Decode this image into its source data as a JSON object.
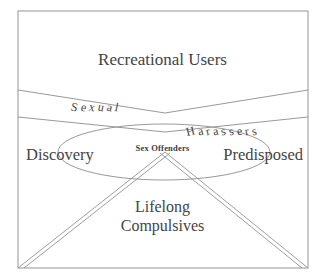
{
  "figure": {
    "title_region": "sex-offender-typology-venn-diagram",
    "frame": {
      "stroke_color": "#9a9a9a",
      "x": 18,
      "y": 11,
      "width": 290,
      "height": 257
    },
    "regions": [
      {
        "name": "recreational-users",
        "label": "Recreational Users",
        "position": "top"
      },
      {
        "name": "sexual-harassers-band",
        "label_left": "Sexual",
        "label_right": "Harassers",
        "position": "middle-v-band"
      },
      {
        "name": "discovery",
        "label": "Discovery",
        "position": "left-ellipse"
      },
      {
        "name": "predisposed",
        "label": "Predisposed",
        "position": "right-ellipse"
      },
      {
        "name": "sex-offenders",
        "label": "Sex Offenders",
        "position": "center-intersection"
      },
      {
        "name": "lifelong-compulsives",
        "label_line1": "Lifelong",
        "label_line2": "Compulsives",
        "position": "bottom-triangle"
      }
    ],
    "shapes": {
      "band_upper_left_y": 90,
      "band_lower_left_y": 117,
      "band_apex_x": 165,
      "band_apex_upper_y": 113,
      "band_apex_lower_y": 132,
      "ellipse_cx": 164,
      "ellipse_cy": 152,
      "ellipse_rx": 106,
      "ellipse_ry": 28,
      "triangle_apex_x": 165,
      "triangle_apex_y": 152,
      "stroke_color": "#8d8d8d"
    }
  },
  "labels": {
    "recreational_users": "Recreational Users",
    "sexual": "Sexual",
    "harassers": "Harassers",
    "discovery": "Discovery",
    "predisposed": "Predisposed",
    "sex_offenders": "Sex Offenders",
    "lifelong": "Lifelong",
    "compulsives": "Compulsives"
  }
}
